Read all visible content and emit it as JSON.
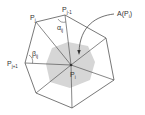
{
  "diagram": {
    "labels": {
      "center": {
        "base": "P",
        "sub": "i"
      },
      "p_j": {
        "base": "P",
        "sub": "j"
      },
      "p_j_minus_1": {
        "base": "P",
        "sub": "j-1"
      },
      "p_j_plus_1": {
        "base": "P",
        "sub": "j+1"
      },
      "alpha": {
        "base": "α",
        "sub": "ij"
      },
      "beta": {
        "base": "β",
        "sub": "ij"
      },
      "area": "A(P",
      "area_sub": "i",
      "area_close": ")"
    },
    "colors": {
      "edge": "#555555",
      "area_fill": "#d6d6d6",
      "text": "#333333"
    }
  }
}
